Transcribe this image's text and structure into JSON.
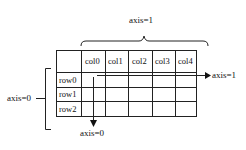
{
  "diagram": {
    "columns": [
      "col0",
      "col1",
      "col2",
      "col3",
      "col4"
    ],
    "rows": [
      "row0",
      "row1",
      "row2"
    ],
    "labels": {
      "axis1_top": "axis=1",
      "axis1_arrow": "axis=1",
      "axis0_left": "axis=0",
      "axis0_arrow": "axis=0"
    },
    "colors": {
      "line": "#111111",
      "background": "#ffffff"
    }
  }
}
